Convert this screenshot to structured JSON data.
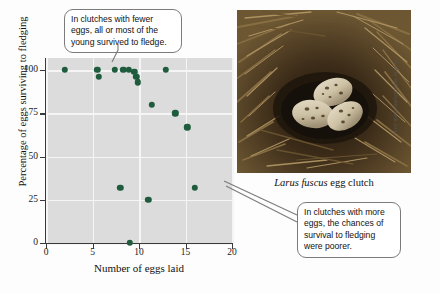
{
  "figure": {
    "photo_caption_species": "Larus fuscus",
    "photo_caption_rest": " egg clutch",
    "photo_credit": "© tony mills/Shutterstock.com",
    "photo_alt": "nest-with-three-speckled-eggs"
  },
  "callouts": {
    "top": "In clutches with fewer eggs, all or most of the young survived to fledge.",
    "bottom": "In clutches with more eggs, the chances of survival to fledging were poorer."
  },
  "chart_data": {
    "type": "scatter",
    "title": "",
    "xlabel": "Number of eggs laid",
    "ylabel": "Percentage of eggs surviving to fledging",
    "xlim": [
      0,
      20
    ],
    "ylim": [
      0,
      107
    ],
    "xticks": [
      0,
      5,
      10,
      15,
      20
    ],
    "yticks": [
      0,
      25,
      50,
      75,
      100
    ],
    "xticklabels": [
      "0",
      "5",
      "10",
      "15",
      "20"
    ],
    "yticklabels": [
      "0",
      "25",
      "50",
      "75",
      "100"
    ],
    "grid": true,
    "legend": false,
    "marker_color": "#1f5c3d",
    "plot_background": "#dcdcdc",
    "points": [
      {
        "x": 2.0,
        "y": 100
      },
      {
        "x": 5.5,
        "y": 100
      },
      {
        "x": 5.7,
        "y": 96
      },
      {
        "x": 7.4,
        "y": 100
      },
      {
        "x": 8.3,
        "y": 100
      },
      {
        "x": 8.9,
        "y": 100
      },
      {
        "x": 9.5,
        "y": 99
      },
      {
        "x": 9.7,
        "y": 96
      },
      {
        "x": 9.9,
        "y": 93
      },
      {
        "x": 12.9,
        "y": 100
      },
      {
        "x": 11.4,
        "y": 80
      },
      {
        "x": 13.9,
        "y": 75
      },
      {
        "x": 15.2,
        "y": 67
      },
      {
        "x": 8.0,
        "y": 32
      },
      {
        "x": 16.0,
        "y": 32
      },
      {
        "x": 11.0,
        "y": 25
      },
      {
        "x": 9.0,
        "y": 0
      }
    ]
  }
}
